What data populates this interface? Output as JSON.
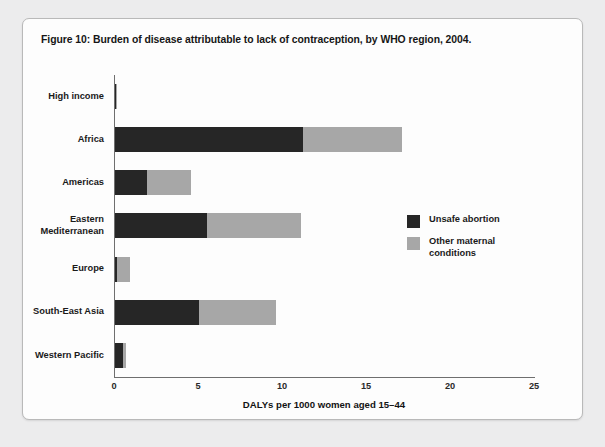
{
  "figure": {
    "title": "Figure 10: Burden of disease attributable to lack of contraception, by WHO region, 2004."
  },
  "colors": {
    "unsafe_abortion": "#262626",
    "other_maternal": "#a7a7a7",
    "axis": "#6f6f6f",
    "card_background": "#fdfdfd",
    "page_background": "#ececed"
  },
  "legend": {
    "position": "inside-right",
    "items": [
      {
        "label": "Unsafe abortion",
        "color": "#262626"
      },
      {
        "label": "Other maternal\nconditions",
        "color": "#a7a7a7"
      }
    ]
  },
  "chart_data": {
    "type": "bar",
    "orientation": "horizontal",
    "stacked": true,
    "title": "Figure 10: Burden of disease attributable to lack of contraception, by WHO region, 2004.",
    "xlabel": "DALYs per 1000 women aged 15–44",
    "ylabel": "",
    "xlim": [
      0,
      25
    ],
    "xticks": [
      0,
      5,
      10,
      15,
      20,
      25
    ],
    "xtick_labels": [
      "0",
      "5",
      "10",
      "15",
      "20",
      "25"
    ],
    "grid": false,
    "categories": [
      "High income",
      "Africa",
      "Americas",
      "Eastern\nMediterranean",
      "Europe",
      "South-East Asia",
      "Western Pacific"
    ],
    "series": [
      {
        "name": "Unsafe abortion",
        "color": "#262626",
        "values": [
          0.05,
          11.2,
          1.9,
          5.5,
          0.1,
          5.0,
          0.45
        ]
      },
      {
        "name": "Other maternal conditions",
        "color": "#a7a7a7",
        "values": [
          0.05,
          5.9,
          2.6,
          5.6,
          0.8,
          4.6,
          0.2
        ]
      }
    ],
    "totals": [
      0.1,
      17.1,
      4.5,
      11.1,
      0.9,
      9.6,
      0.65
    ]
  }
}
